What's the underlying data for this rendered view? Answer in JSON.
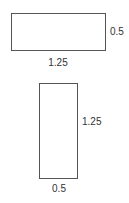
{
  "rectangles": [
    {
      "orientation": "landscape",
      "width_label": "1.25",
      "height_label": "0.5"
    },
    {
      "orientation": "portrait",
      "width_label": "0.5",
      "height_label": "1.25"
    }
  ],
  "colors": {
    "stroke": "#555555",
    "text": "#333333",
    "background": "#ffffff"
  }
}
